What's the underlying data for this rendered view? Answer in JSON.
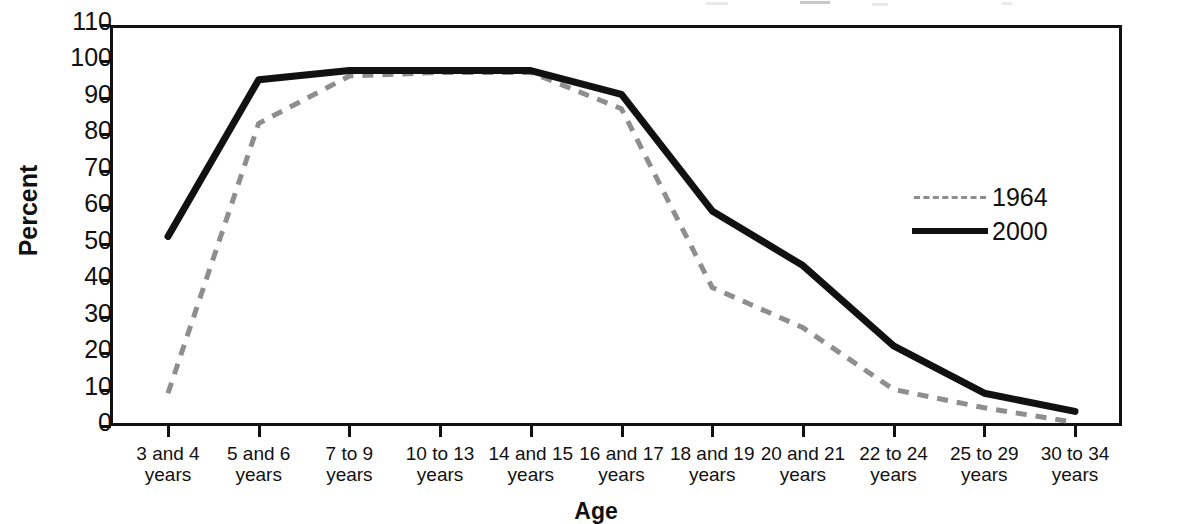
{
  "axes": {
    "ylabel": "Percent",
    "xlabel": "Age",
    "yticks": [
      "0",
      "10",
      "20",
      "30",
      "40",
      "50",
      "60",
      "70",
      "80",
      "90",
      "100",
      "110"
    ]
  },
  "legend": {
    "position": "inside-right",
    "items": [
      {
        "label": "1964",
        "style": "dashed",
        "color": "#8e8e8e"
      },
      {
        "label": "2000",
        "style": "solid",
        "color": "#111111"
      }
    ]
  },
  "xlabels": [
    {
      "line1": "3 and 4",
      "line2": "years"
    },
    {
      "line1": "5 and 6",
      "line2": "years"
    },
    {
      "line1": "7 to 9",
      "line2": "years"
    },
    {
      "line1": "10 to 13",
      "line2": "years"
    },
    {
      "line1": "14 and 15",
      "line2": "years"
    },
    {
      "line1": "16 and 17",
      "line2": "years"
    },
    {
      "line1": "18 and 19",
      "line2": "years"
    },
    {
      "line1": "20 and 21",
      "line2": "years"
    },
    {
      "line1": "22 to 24",
      "line2": "years"
    },
    {
      "line1": "25 to 29",
      "line2": "years"
    },
    {
      "line1": "30 to 34",
      "line2": "years"
    }
  ],
  "chart_data": {
    "type": "line",
    "title": "",
    "xlabel": "Age",
    "ylabel": "Percent",
    "ylim": [
      0,
      110
    ],
    "ytick_step": 10,
    "grid": false,
    "legend_position": "inside-right",
    "categories": [
      "3 and 4 years",
      "5 and 6 years",
      "7 to 9 years",
      "10 to 13 years",
      "14 and 15 years",
      "16 and 17 years",
      "18 and 19 years",
      "20 and 21 years",
      "22 to 24 years",
      "25 to 29 years",
      "30 to 34 years"
    ],
    "series": [
      {
        "name": "1964",
        "style": "dashed",
        "color": "#8e8e8e",
        "values": [
          9,
          83,
          96,
          97,
          97,
          87,
          38,
          27,
          10,
          5,
          1
        ]
      },
      {
        "name": "2000",
        "style": "solid",
        "color": "#111111",
        "values": [
          52,
          95,
          97.5,
          97.5,
          97.5,
          91,
          59,
          44,
          22,
          9,
          4
        ]
      }
    ]
  }
}
